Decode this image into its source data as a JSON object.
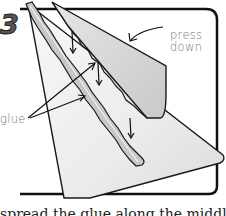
{
  "illustration": {
    "step_number": "3",
    "labels": {
      "press_down": "press\ndown",
      "press_line1": "press",
      "press_line2": "down",
      "glue": "glue"
    },
    "caption_partial": "spread the glue along the middle line of"
  },
  "colors": {
    "ink": "#1a1a1a",
    "paper_shade": "#d9d9d9",
    "paper_light": "#f0f0f0",
    "label_gray": "#777777",
    "badge_gray": "#555555"
  }
}
